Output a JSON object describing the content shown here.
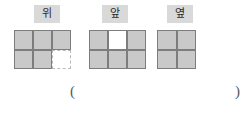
{
  "page": {
    "background_color": "#ffffff",
    "cell_fill_color": "#c9c9c9",
    "cell_border_color": "#7d7d7d",
    "label_highlight_color": "#d9d9d9",
    "dashed_border_color": "#b9b9b9"
  },
  "views": [
    {
      "id": "top-view",
      "label": "위",
      "columns": 3,
      "rows": 2,
      "cells": [
        {
          "state": "filled"
        },
        {
          "state": "filled"
        },
        {
          "state": "filled"
        },
        {
          "state": "filled"
        },
        {
          "state": "filled"
        },
        {
          "state": "empty-dashed"
        }
      ]
    },
    {
      "id": "front-view",
      "label": "앞",
      "columns": 3,
      "rows": 2,
      "cells": [
        {
          "state": "filled"
        },
        {
          "state": "empty-solid"
        },
        {
          "state": "filled"
        },
        {
          "state": "filled"
        },
        {
          "state": "filled"
        },
        {
          "state": "filled"
        }
      ]
    },
    {
      "id": "side-view",
      "label": "옆",
      "columns": 2,
      "rows": 2,
      "cells": [
        {
          "state": "filled"
        },
        {
          "state": "filled"
        },
        {
          "state": "filled"
        },
        {
          "state": "filled"
        }
      ]
    }
  ],
  "answer": {
    "open_paren": "(",
    "close_paren": ")",
    "value": ""
  }
}
